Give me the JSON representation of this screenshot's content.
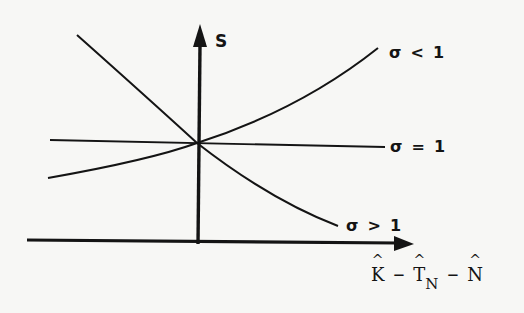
{
  "diagram": {
    "y_axis": {
      "label": "S"
    },
    "x_axis": {
      "label_parts": [
        "K",
        "−",
        "T",
        "N",
        "−",
        "N"
      ],
      "label_text": "K̂ − T̂N − N̂"
    },
    "curves": [
      {
        "id": "sigma-less-1",
        "label_symbol": "σ",
        "label_op": "<",
        "label_value": "1",
        "shape": "upward-sloping convex"
      },
      {
        "id": "sigma-equal-1",
        "label_symbol": "σ",
        "label_op": "=",
        "label_value": "1",
        "shape": "nearly flat line"
      },
      {
        "id": "sigma-greater-1",
        "label_symbol": "σ",
        "label_op": ">",
        "label_value": "1",
        "shape": "downward-sloping convex"
      }
    ],
    "ink_color": "#141414",
    "background_color": "#f7f7f5"
  }
}
